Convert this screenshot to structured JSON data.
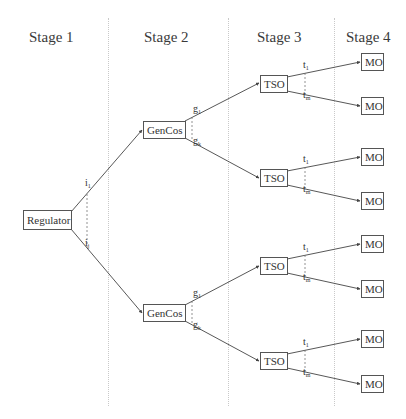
{
  "stages": [
    {
      "label": "Stage 1"
    },
    {
      "label": "Stage 2"
    },
    {
      "label": "Stage 3"
    },
    {
      "label": "Stage 4"
    }
  ],
  "nodes": {
    "regulator": "Regulator",
    "gencos_top": "GenCos",
    "gencos_bottom": "GenCos",
    "tso_1": "TSO",
    "tso_2": "TSO",
    "tso_3": "TSO",
    "tso_4": "TSO",
    "mo_1": "MO",
    "mo_2": "MO",
    "mo_3": "MO",
    "mo_4": "MO",
    "mo_5": "MO",
    "mo_6": "MO",
    "mo_7": "MO",
    "mo_8": "MO"
  },
  "branch_labels": {
    "regulator": {
      "first": "i",
      "first_sub": "1",
      "last": "i",
      "last_sub": "j"
    },
    "gencos": {
      "first": "g",
      "first_sub": "1",
      "last": "g",
      "last_sub": "k"
    },
    "tso": {
      "first": "t",
      "first_sub": "1",
      "last": "t",
      "last_sub": "m"
    }
  },
  "colors": {
    "line": "#444444",
    "divider": "#c9c9c9",
    "box_border": "#555555"
  }
}
